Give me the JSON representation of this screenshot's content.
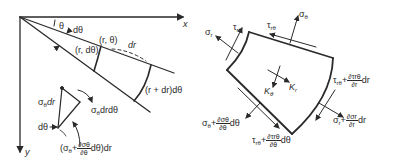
{
  "figure": {
    "left_panel": {
      "axes": {
        "x_label": "x",
        "y_label": "y"
      },
      "labels": {
        "theta": "θ",
        "dtheta": "dθ",
        "point_r_theta": "(r, θ)",
        "point_r_dtheta": "(r, dθ)",
        "dr": "dr",
        "arc_outer": "(r + dr)dθ"
      },
      "inset": {
        "side_label": "σθdr",
        "side_sigma": "σ",
        "side_sub": "θ",
        "side_tail": "dr",
        "rotated_label_sigma": "σ",
        "rotated_label_sub": "θ",
        "rotated_label_tail": "drdθ",
        "angle_label": "dθ",
        "bottom_open": "(σ",
        "bottom_sub": "θ",
        "bottom_plus": "+",
        "bottom_num": "∂σθ",
        "bottom_den": "∂θ",
        "bottom_tail": "dθ)dr"
      }
    },
    "right_panel": {
      "labels": {
        "sigma_r": "σ",
        "sigma_r_sub": "r",
        "tau_left": "τ",
        "tau_left_sub": "rθ",
        "tau_top": "τ",
        "tau_top_sub": "rθ",
        "sigma_theta": "σ",
        "sigma_theta_sub": "θ",
        "K_theta": "K",
        "K_theta_sub": "θ",
        "K_r": "K",
        "K_r_sub": "r",
        "tau_right_base": "τ",
        "tau_right_sub": "rθ",
        "tau_right_plus": "+",
        "tau_right_num": "∂τrθ",
        "tau_right_den": "∂r",
        "tau_right_tail": "dr",
        "sigma_r2_base": "σ",
        "sigma_r2_sub": "r",
        "sigma_r2_plus": "+",
        "sigma_r2_num": "∂σr",
        "sigma_r2_den": "∂r",
        "sigma_r2_tail": "dr",
        "sigma_theta2_base": "σ",
        "sigma_theta2_sub": "θ",
        "sigma_theta2_plus": "+",
        "sigma_theta2_num": "∂σθ",
        "sigma_theta2_den": "∂θ",
        "sigma_theta2_tail": "dθ",
        "tau_bottom_base": "τ",
        "tau_bottom_sub": "rθ",
        "tau_bottom_plus": "+",
        "tau_bottom_num": "∂τrθ",
        "tau_bottom_den": "∂θ",
        "tau_bottom_tail": "dθ"
      }
    },
    "colors": {
      "ink": "#2a2a2a",
      "background": "#ffffff"
    }
  }
}
